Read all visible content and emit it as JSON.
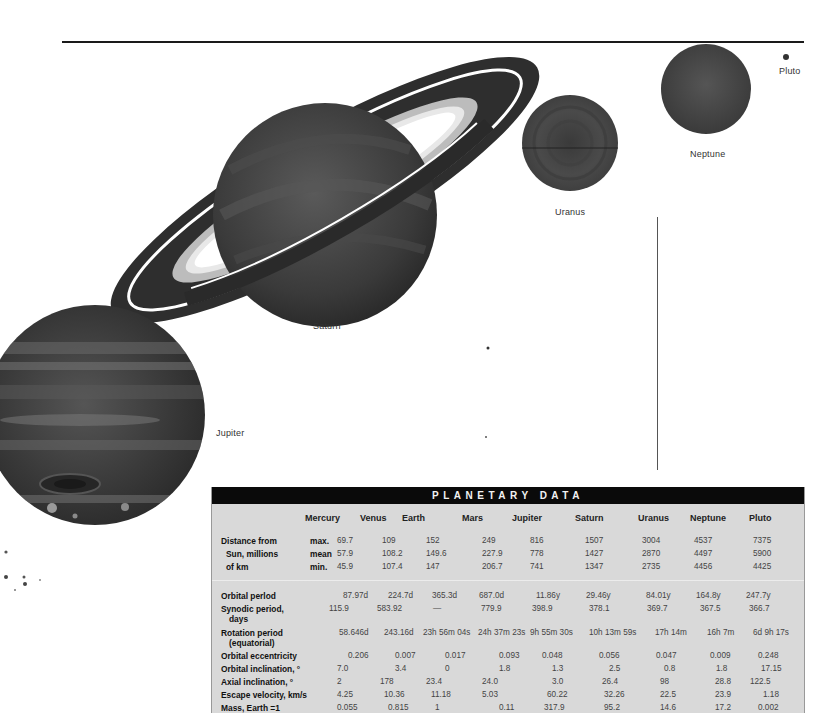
{
  "illustration": {
    "planet_labels": {
      "jupiter": "Jupiter",
      "saturn": "Saturn",
      "uranus": "Uranus",
      "neptune": "Neptune",
      "pluto": "Pluto"
    }
  },
  "table": {
    "title": "PLANETARY DATA",
    "columns": [
      "Mercury",
      "Venus",
      "Earth",
      "Mars",
      "Jupiter",
      "Saturn",
      "Uranus",
      "Neptune",
      "Pluto"
    ],
    "distance": {
      "label_lines": [
        "Distance from",
        "Sun, millions",
        "of km"
      ],
      "sub_labels": [
        "max.",
        "mean",
        "min."
      ],
      "max": [
        "69.7",
        "109",
        "152",
        "249",
        "816",
        "1507",
        "3004",
        "4537",
        "7375"
      ],
      "mean": [
        "57.9",
        "108.2",
        "149.6",
        "227.9",
        "778",
        "1427",
        "2870",
        "4497",
        "5900"
      ],
      "min": [
        "45.9",
        "107.4",
        "147",
        "206.7",
        "741",
        "1347",
        "2735",
        "4456",
        "4425"
      ]
    },
    "rows": [
      {
        "label": "Orbital perlod",
        "label2": "",
        "values": [
          "87.97d",
          "224.7d",
          "365.3d",
          "687.0d",
          "11.86y",
          "29.46y",
          "84.01y",
          "164.8y",
          "247.7y"
        ]
      },
      {
        "label": "Synodic period,",
        "label2": "days",
        "values": [
          "115.9",
          "583.92",
          "—",
          "779.9",
          "398.9",
          "378.1",
          "369.7",
          "367.5",
          "366.7"
        ]
      },
      {
        "label": "Rotation period",
        "label2": "(equatorial)",
        "values": [
          "58.646d",
          "243.16d",
          "23h 56m 04s",
          "24h 37m 23s",
          "9h 55m 30s",
          "10h 13m 59s",
          "17h 14m",
          "16h 7m",
          "6d 9h 17s"
        ]
      },
      {
        "label": "Orbital eccentricity",
        "label2": "",
        "values": [
          "0.206",
          "0.007",
          "0.017",
          "0.093",
          "0.048",
          "0.056",
          "0.047",
          "0.009",
          "0.248"
        ]
      },
      {
        "label": "Orbital inclination, °",
        "label2": "",
        "values": [
          "7.0",
          "3.4",
          "0",
          "1.8",
          "1.3",
          "2.5",
          "0.8",
          "1.8",
          "17.15"
        ]
      },
      {
        "label": "Axial inclination, °",
        "label2": "",
        "values": [
          "2",
          "178",
          "23.4",
          "24.0",
          "3.0",
          "26.4",
          "98",
          "28.8",
          "122.5"
        ]
      },
      {
        "label": "Escape velocity, km/s",
        "label2": "",
        "values": [
          "4.25",
          "10.36",
          "11.18",
          "5.03",
          "60.22",
          "32.26",
          "22.5",
          "23.9",
          "1.18"
        ]
      },
      {
        "label": "Mass, Earth =1",
        "label2": "",
        "values": [
          "0.055",
          "0.815",
          "1",
          "0.11",
          "317.9",
          "95.2",
          "14.6",
          "17.2",
          "0.002"
        ]
      }
    ]
  }
}
